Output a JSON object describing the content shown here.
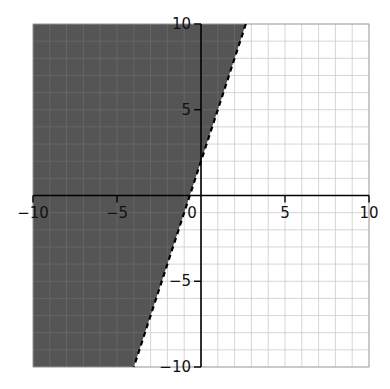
{
  "chart_data": {
    "type": "inequality-graph",
    "title": "",
    "inequality": "y > 3x + 2",
    "boundary": {
      "slope": 3,
      "intercept": 2,
      "style": "dashed"
    },
    "shaded_region": "above-left of line",
    "xlim": [
      -10,
      10
    ],
    "ylim": [
      -10,
      10
    ],
    "grid": true,
    "grid_step": 1,
    "x_ticks": [
      -10,
      -5,
      0,
      5,
      10
    ],
    "y_ticks": [
      -10,
      -5,
      5,
      10
    ],
    "x_tick_labels": [
      "−10",
      "−5",
      "0",
      "5",
      "10"
    ],
    "y_tick_labels": [
      "−10",
      "−5",
      "5",
      "10"
    ],
    "colors": {
      "shade": "#555555",
      "shade_grid": "#6a6a6a",
      "grid": "#cccccc",
      "axis": "#000000",
      "boundary": "#000000"
    }
  }
}
